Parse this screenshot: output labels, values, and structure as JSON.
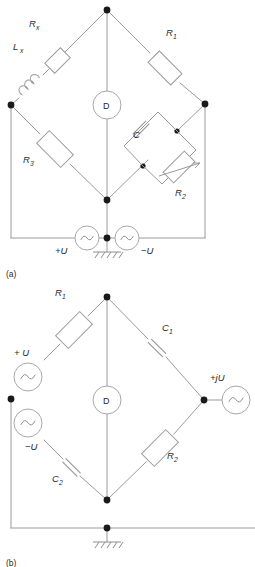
{
  "figure": {
    "panels": [
      {
        "id": "a",
        "caption": "(a)",
        "type": "maxwell-wien-bridge",
        "components": [
          {
            "name": "Rx",
            "label": "R",
            "sub": "x",
            "kind": "resistor"
          },
          {
            "name": "Lx",
            "label": "L",
            "sub": "x",
            "kind": "inductor"
          },
          {
            "name": "R1",
            "label": "R",
            "sub": "1",
            "kind": "resistor"
          },
          {
            "name": "R3",
            "label": "R",
            "sub": "3",
            "kind": "resistor"
          },
          {
            "name": "C",
            "label": "C",
            "sub": "",
            "kind": "capacitor"
          },
          {
            "name": "R2",
            "label": "R",
            "sub": "2",
            "kind": "variable-resistor"
          },
          {
            "name": "D",
            "label": "D",
            "sub": "",
            "kind": "detector"
          }
        ],
        "sources": [
          {
            "name": "source-plus-u",
            "label": "+U",
            "kind": "ac-source"
          },
          {
            "name": "source-minus-u",
            "label": "−U",
            "kind": "ac-source"
          }
        ],
        "ground": {
          "name": "ground",
          "kind": "earth-ground"
        }
      },
      {
        "id": "b",
        "caption": "(b)",
        "type": "capacitance-bridge",
        "components": [
          {
            "name": "R1",
            "label": "R",
            "sub": "1",
            "kind": "resistor"
          },
          {
            "name": "C1",
            "label": "C",
            "sub": "1",
            "kind": "capacitor"
          },
          {
            "name": "C2",
            "label": "C",
            "sub": "2",
            "kind": "capacitor"
          },
          {
            "name": "R2",
            "label": "R",
            "sub": "2",
            "kind": "resistor"
          },
          {
            "name": "D",
            "label": "D",
            "sub": "",
            "kind": "detector"
          }
        ],
        "sources": [
          {
            "name": "source-plus-u",
            "label": "+ U",
            "kind": "ac-source"
          },
          {
            "name": "source-minus-u",
            "label": "−U",
            "kind": "ac-source"
          },
          {
            "name": "source-plus-ju",
            "label": "+jU",
            "kind": "ac-source"
          }
        ],
        "ground": {
          "name": "ground",
          "kind": "earth-ground"
        }
      }
    ],
    "colors": {
      "wire": "#9a9a9a",
      "node": "#1a1a1a",
      "text": "#2b2b2b",
      "background": "#ffffff"
    }
  }
}
